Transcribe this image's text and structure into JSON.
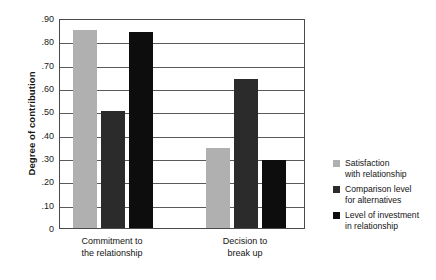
{
  "chart_data": {
    "type": "bar",
    "title": "",
    "xlabel": "",
    "ylabel": "Degree of contribution",
    "ylim": [
      0,
      0.9
    ],
    "grid": true,
    "legend_position": "right",
    "categories": [
      "Commitment to\nthe relationship",
      "Decision to\nbreak up"
    ],
    "category_lines": [
      [
        "Commitment to",
        "the relationship"
      ],
      [
        "Decision to",
        "break up"
      ]
    ],
    "ytick_labels": [
      ".90",
      ".80",
      ".70",
      ".60",
      ".50",
      ".40",
      ".30",
      ".20",
      ".10",
      "0"
    ],
    "ytick_values": [
      0.9,
      0.8,
      0.7,
      0.6,
      0.5,
      0.4,
      0.3,
      0.2,
      0.1,
      0.0
    ],
    "series": [
      {
        "name": "Satisfaction with relationship",
        "name_lines": [
          "Satisfaction",
          "with relationship"
        ],
        "color": "#b0b0b0",
        "values": [
          0.85,
          0.345
        ]
      },
      {
        "name": "Comparison level for alternatives",
        "name_lines": [
          "Comparison level",
          "for alternatives"
        ],
        "color": "#2b2b2b",
        "values": [
          0.5,
          0.64
        ]
      },
      {
        "name": "Level of investment in relationship",
        "name_lines": [
          "Level of investment",
          "in relationship"
        ],
        "color": "#0d0d0d",
        "values": [
          0.84,
          0.29
        ]
      }
    ]
  },
  "axis": {
    "y_title": "Degree of contribution"
  },
  "legend": {
    "entries": [
      {
        "label": "Satisfaction\nwith relationship",
        "color": "#b0b0b0"
      },
      {
        "label": "Comparison level\nfor alternatives",
        "color": "#2b2b2b"
      },
      {
        "label": "Level of investment\nin relationship",
        "color": "#0d0d0d"
      }
    ]
  },
  "colors": {
    "frame": "#4a4a4a",
    "gridline": "#5a5a5a",
    "text": "#141414",
    "background": "#ffffff"
  }
}
